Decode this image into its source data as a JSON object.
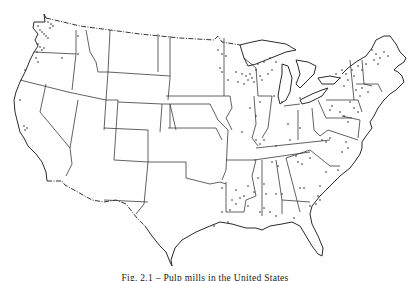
{
  "figure": {
    "caption": "Fig. 2.1 – Pulp mills in the United States",
    "marker_symbol": "dot",
    "marker_meaning": "mill location",
    "ink_color": "#2a2a2a",
    "background_color": "#ffffff"
  },
  "map": {
    "regions_with_dense_markers": [
      "Washington",
      "Oregon",
      "Wisconsin",
      "Michigan",
      "Maine",
      "New Hampshire",
      "Vermont",
      "New York",
      "Pennsylvania",
      "Louisiana",
      "Mississippi",
      "Alabama",
      "Georgia",
      "Virginia",
      "North Carolina"
    ],
    "regions_with_sparse_markers": [
      "California",
      "Idaho",
      "Minnesota",
      "Iowa",
      "Illinois",
      "Ohio",
      "Kentucky",
      "Tennessee",
      "Arkansas",
      "Texas",
      "South Carolina",
      "Florida",
      "Maryland"
    ]
  }
}
